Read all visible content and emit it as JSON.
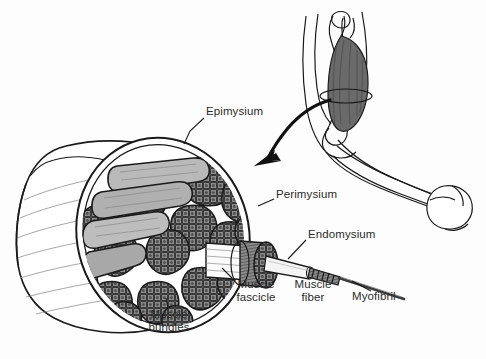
{
  "figure": {
    "width": 486,
    "height": 359,
    "background": "#ffffff"
  },
  "colors": {
    "ink": "#1a1a1a",
    "label_text": "#2b2b2b",
    "sheath_fill": "#ffffff",
    "fascicle_light": "#b9b9b9",
    "fascicle_dark": "#6f6f6f",
    "stipple": "#3c3c3c",
    "arm_muscle": "#6a6a6a",
    "arm_skin": "#ffffff",
    "fiber_fill": "#f2f2f2",
    "myofibril": "#4a4a4a"
  },
  "labels": {
    "epimysium": {
      "text": "Epimysium",
      "x": 206,
      "y": 112
    },
    "perimysium": {
      "text": "Perimysium",
      "x": 276,
      "y": 195
    },
    "endomysium": {
      "text": "Endomysium",
      "x": 308,
      "y": 235
    },
    "muscle_fascicle": {
      "line1": "Muscle",
      "line2": "fascicle",
      "x": 228,
      "y": 283
    },
    "muscle_fiber": {
      "line1": "Muscle",
      "line2": "fiber",
      "x": 288,
      "y": 283
    },
    "myofibril": {
      "text": "Myofibril",
      "x": 352,
      "y": 295
    },
    "muscle_bundles": {
      "line1": "Muscle",
      "line2": "bundles",
      "x": 141,
      "y": 313
    }
  },
  "structures": {
    "arm": {
      "name": "flexed-arm-with-biceps",
      "muscle_name": "biceps brachii",
      "cross_section_plane": "ellipse"
    },
    "arrow": {
      "name": "magnification-arrow",
      "from": "arm cross-section",
      "to": "enlarged muscle bundle"
    },
    "muscle_bundle": {
      "name": "cut-muscle-cylinder",
      "fascicle_count": 22
    },
    "chain": [
      "muscle fascicle",
      "muscle fiber",
      "myofibril"
    ]
  }
}
